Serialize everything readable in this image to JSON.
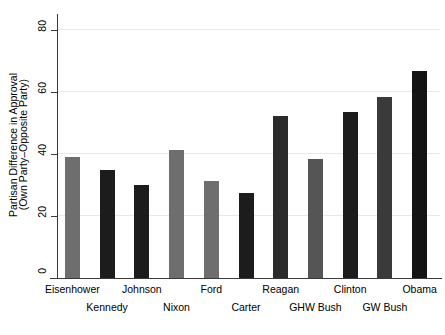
{
  "chart_data": {
    "type": "bar",
    "title": "",
    "subtitle": "",
    "xlabel": "",
    "ylabel": "Partisan Difference in Approval (Own Party–Opposite Party)",
    "ylabel_lines": [
      "Partisan Difference in Approval",
      "(Own Party–Opposite Party)"
    ],
    "ylim": [
      0,
      84
    ],
    "yticks": [
      0,
      20,
      40,
      60,
      80
    ],
    "ytick_labels": [
      "0",
      "20",
      "40",
      "60",
      "80"
    ],
    "grid": "horizontal",
    "legend": "none",
    "categories": [
      "Eisenhower",
      "Kennedy",
      "Johnson",
      "Nixon",
      "Ford",
      "Carter",
      "Reagan",
      "GHW Bush",
      "Clinton",
      "GW Bush",
      "Obama"
    ],
    "values": [
      39,
      35,
      30,
      41.5,
      31.5,
      27.5,
      52.5,
      38.5,
      53.5,
      58.5,
      67
    ],
    "bar_colors": [
      "#6e6e6e",
      "#1c1c1c",
      "#1c1c1c",
      "#6e6e6e",
      "#6e6e6e",
      "#1c1c1c",
      "#2b2b2b",
      "#555555",
      "#1c1c1c",
      "#3a3a3a",
      "#141414"
    ],
    "label_rows": [
      0,
      1,
      0,
      1,
      0,
      1,
      0,
      1,
      0,
      1,
      0
    ],
    "axis_color": "#3a3a3a",
    "grid_color": "#e8e8e8",
    "background": "#ffffff"
  }
}
